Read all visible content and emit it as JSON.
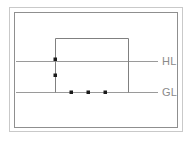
{
  "diagram": {
    "background_color": "#ffffff",
    "frame": {
      "outer_color": "#c9c9c9",
      "inner_color": "#8f8f8f"
    },
    "labels": {
      "high_level": "HL",
      "ground_level": "GL",
      "label_color": "#8a8a8a"
    },
    "reference_lines": [
      {
        "name": "high-level-line",
        "label": "HL",
        "color": "#9a9a9a",
        "y": 61,
        "x_start": 16,
        "x_end": 158
      },
      {
        "name": "ground-level-line",
        "label": "GL",
        "color": "#9a9a9a",
        "y": 92,
        "x_start": 16,
        "x_end": 158
      }
    ],
    "structure": {
      "name": "rectangle-outline",
      "color": "#808080",
      "left": 55,
      "top": 38,
      "right": 128,
      "bottom": 92,
      "open_bottom": true
    },
    "points": [
      {
        "name": "point-wall-upper",
        "x": 55,
        "y": 59,
        "color": "#1a1a1a"
      },
      {
        "name": "point-wall-lower",
        "x": 55,
        "y": 75,
        "color": "#1a1a1a"
      },
      {
        "name": "point-base-1",
        "x": 71,
        "y": 92,
        "color": "#1a1a1a"
      },
      {
        "name": "point-base-2",
        "x": 88,
        "y": 92,
        "color": "#1a1a1a"
      },
      {
        "name": "point-base-3",
        "x": 105,
        "y": 92,
        "color": "#1a1a1a"
      }
    ]
  }
}
